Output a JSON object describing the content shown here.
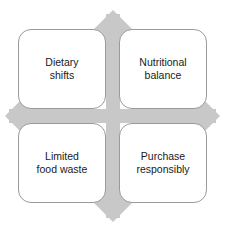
{
  "diagram": {
    "type": "four-quadrant-matrix-with-four-headed-arrow",
    "background_color": "#ffffff",
    "arrow": {
      "name": "four-headed-arrow",
      "fill_color": "#c8c8c8",
      "directions": [
        "up",
        "right",
        "down",
        "left"
      ]
    },
    "box_style": {
      "fill_color": "#ffffff",
      "border_color": "#9a9a9a",
      "text_color": "#1a1a1a"
    },
    "quadrants": [
      {
        "position": "top-left",
        "label": "Dietary\nshifts"
      },
      {
        "position": "top-right",
        "label": "Nutritional\nbalance"
      },
      {
        "position": "bottom-left",
        "label": "Limited\nfood waste"
      },
      {
        "position": "bottom-right",
        "label": "Purchase\nresponsibly"
      }
    ]
  }
}
